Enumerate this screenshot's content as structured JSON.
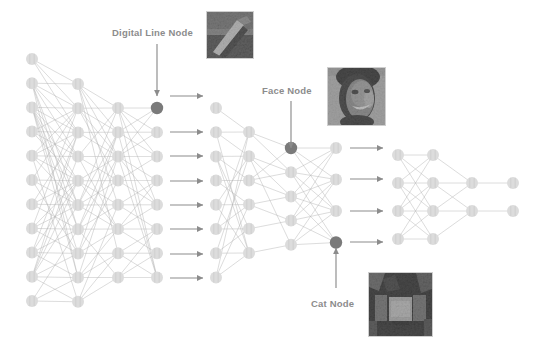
{
  "diagram": {
    "background_color": "#ffffff",
    "node_color": "#dcdcdc",
    "node_highlight_color": "#7a7a7a",
    "edge_color": "#b4b4b4",
    "arrow_color": "#8c8c8c",
    "label_color": "#8c8c8c"
  },
  "labels": [
    {
      "id": "digital-line-node",
      "text": "Digital Line Node",
      "x": 112,
      "y": 27,
      "arrow": {
        "x": 157,
        "y1": 44,
        "y2": 96
      }
    },
    {
      "id": "face-node",
      "text": "Face Node",
      "x": 262,
      "y": 85,
      "arrow": {
        "x": 291,
        "y1": 101,
        "y2": 148
      }
    },
    {
      "id": "cat-node",
      "text": "Cat Node",
      "x": 311,
      "y": 298,
      "arrow": {
        "x": 336,
        "y1": 288,
        "y2": 248
      }
    }
  ],
  "thumbnails": [
    {
      "id": "digital-line-thumb",
      "caption": "digital line edge feature patch",
      "x": 206,
      "y": 11,
      "w": 46,
      "h": 46
    },
    {
      "id": "face-thumb",
      "caption": "human face feature patch",
      "x": 327,
      "y": 67,
      "w": 57,
      "h": 57
    },
    {
      "id": "cat-thumb",
      "caption": "cat face feature patch",
      "x": 368,
      "y": 272,
      "w": 63,
      "h": 63
    }
  ],
  "blocks": [
    {
      "id": "block-1",
      "columns": [
        {
          "x": 32,
          "count": 11,
          "y0": 59,
          "gap": 24.2
        },
        {
          "x": 78,
          "count": 10,
          "y0": 84,
          "gap": 24.2
        },
        {
          "x": 118,
          "count": 8,
          "y0": 108,
          "gap": 24.2
        },
        {
          "x": 157,
          "count": 8,
          "y0": 108,
          "gap": 24.2
        }
      ],
      "highlight": {
        "column": 3,
        "index": 0
      }
    },
    {
      "id": "block-2",
      "columns": [
        {
          "x": 216,
          "count": 8,
          "y0": 108,
          "gap": 24.2
        },
        {
          "x": 249,
          "count": 6,
          "y0": 132,
          "gap": 24.2
        },
        {
          "x": 291,
          "count": 5,
          "y0": 148,
          "gap": 24.2
        },
        {
          "x": 336,
          "count": 4,
          "y0": 148,
          "gap": 31.5
        }
      ],
      "highlight_list": [
        {
          "column": 2,
          "index": 0
        },
        {
          "column": 3,
          "index": 3
        }
      ]
    },
    {
      "id": "block-3",
      "columns": [
        {
          "x": 398,
          "count": 4,
          "y0": 155,
          "gap": 28.0
        },
        {
          "x": 433,
          "count": 4,
          "y0": 155,
          "gap": 28.0
        },
        {
          "x": 472,
          "count": 2,
          "y0": 183,
          "gap": 28.0
        },
        {
          "x": 513,
          "count": 2,
          "y0": 183,
          "gap": 28.0
        }
      ]
    }
  ],
  "flow_arrows": {
    "set_a": {
      "x1": 170,
      "x2": 203,
      "ys": [
        96,
        132,
        156,
        181,
        205,
        229,
        254,
        278
      ]
    },
    "set_b": {
      "x1": 350,
      "x2": 383,
      "ys": [
        148,
        179,
        211,
        242
      ]
    }
  }
}
